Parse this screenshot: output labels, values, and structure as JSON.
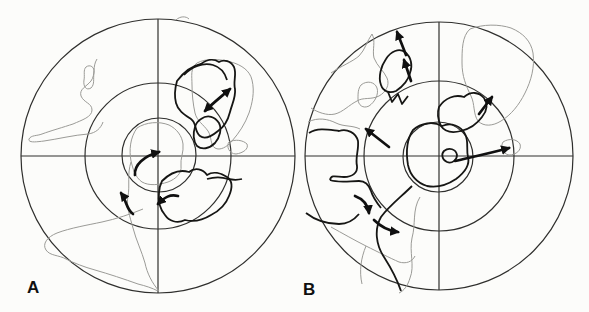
{
  "colors": {
    "background": "#fcfcfa",
    "grid_line": "#2f2f2d",
    "thin_coast": "#9b9b97",
    "bold_coast": "#161614",
    "arrow": "#101010"
  },
  "panels": [
    {
      "label": "A",
      "geometry": {
        "cx": 158,
        "cy": 156,
        "r_outer": 137,
        "r_mid": 73,
        "inner_cx": 159,
        "inner_cy": 155,
        "r_inner": 37,
        "h_line": "M 21,156 L 295,156",
        "v_line": "M 158,19 L 158,293",
        "label_x": 27,
        "label_y": 293
      },
      "thin": [
        "M 97,59 C 92,67 96,74 91,81 C 86,87 79,89 81,96 C 84,103 92,103 92,110 C 92,117 82,120 73,124 C 64,127 50,131 42,134 C 37,136 31,135 29,139 C 28,143 36,142 44,141 C 58,139 74,135 88,134 C 96,133 101,128 103,122",
        "M 86,67 C 90,64 95,67 94,73 C 93,79 95,84 91,88 C 86,91 83,86 84,80 C 85,75 83,70 86,67 Z",
        "M 176,20 C 180,16 186,16 189,19",
        "M 197,63 C 206,58 220,59 231,62 C 242,65 250,71 252,80 C 255,92 252,104 249,113 C 245,124 239,133 232,141 C 227,147 220,151 215,148 C 210,145 212,137 208,131 C 203,124 197,121 195,113 C 193,104 192,94 192,85 C 192,76 190,68 197,63 Z",
        "M 229,142 C 235,139 243,140 247,144 C 249,149 243,153 236,154 C 229,154 226,146 229,142 Z",
        "M 137,128 C 146,122 159,121 169,125 C 177,129 182,136 183,144 C 184,152 180,159 181,166 C 182,173 176,179 168,182 C 159,185 149,186 142,182 C 135,177 133,169 131,161 C 129,150 130,138 137,128 Z",
        "M 131,162 C 127,174 130,186 128,196 C 126,206 130,217 133,228 C 136,240 142,252 145,263 C 147,273 152,283 159,291",
        "M 143,209 C 131,214 116,219 102,222 C 88,225 70,228 57,233 C 47,237 42,244 46,250 C 50,256 59,255 66,259 C 74,263 84,267 95,270 C 109,274 124,279 138,284 C 146,286 152,288 158,291"
      ],
      "bold": [
        "M 177,81 C 183,73 192,66 201,64 C 206,60 213,58 219,62 C 224,59 231,61 234,67 C 237,74 233,81 235,89 C 236,97 232,104 230,112 C 228,120 224,127 218,131 C 212,136 205,140 200,136 C 194,131 197,123 191,119 C 185,115 178,111 176,103 C 174,95 175,88 177,81 Z",
        "M 184,75 C 191,67 203,62 213,65 C 220,67 225,73 227,80",
        "M 201,119 C 208,114 215,117 219,123 C 222,129 220,137 215,143 C 209,149 202,150 197,146 C 193,141 193,133 195,127 C 196,123 198,121 201,119 Z",
        "M 162,181 C 169,174 179,169 189,172 C 195,167 203,169 207,175 C 213,171 221,173 227,177 C 233,181 232,189 229,196 C 226,204 219,211 211,215 C 203,220 193,222 185,220 C 177,224 169,221 165,215 C 160,209 158,201 159,193 C 159,188 160,185 162,181 Z",
        "M 207,179 C 214,177 222,177 228,179 C 233,180 238,180 242,179"
      ],
      "arrows": [
        {
          "name": "antarctica-rotation-arrow",
          "d": "M 135,175 C 134,165 144,156 159,152"
        },
        {
          "name": "africa-spreading-arrow",
          "d": "M 205,111 C 213,103 222,96 230,89"
        },
        {
          "name": "australia-westward-arrow",
          "d": "M 178,196 C 170,194 165,197 158,204"
        },
        {
          "name": "rift-northwest-arrow",
          "d": "M 133,214 C 126,209 127,201 121,193"
        }
      ]
    },
    {
      "label": "B",
      "geometry": {
        "cx": 439,
        "cy": 156,
        "r_outer": 134,
        "r_mid": 75,
        "inner_cx": 438,
        "inner_cy": 157,
        "r_inner": 35,
        "h_line": "M 305,156 L 573,156",
        "v_line": "M 439,22 L 439,290",
        "label_x": 303,
        "label_y": 295
      },
      "thin": [
        "M 331,73 C 341,66 352,62 359,56 C 365,50 367,41 372,34 C 376,41 372,50 374,58 C 377,66 384,71 387,78 C 390,85 386,92 379,96 C 371,100 363,97 357,101 C 349,105 343,112 335,114 C 327,116 317,112 311,108",
        "M 361,85 C 367,80 375,82 377,88 C 379,94 375,102 369,106 C 363,109 358,105 358,99 C 358,93 358,89 361,85 Z",
        "M 308,122 C 318,117 328,119 336,123 C 344,127 352,125 360,129",
        "M 470,29 C 483,24 499,24 511,28 C 523,33 531,41 533,53 C 535,67 531,81 525,93 C 519,105 511,115 501,121 C 493,126 484,127 478,121 C 473,114 475,104 471,96 C 466,86 462,76 462,63 C 462,50 462,36 470,29 Z",
        "M 503,142 C 509,138 517,139 520,144 C 522,150 516,155 509,155 C 503,154 500,147 503,142 Z",
        "M 420,197 C 412,210 416,224 412,238 C 409,252 415,266 410,278 C 408,285 404,291 399,293",
        "M 331,227 C 342,233 354,240 366,246 C 378,252 390,258 399,262 C 406,264 412,262 415,256",
        "M 366,246 C 361,258 359,271 362,284"
      ],
      "bold": [
        "M 309,133 C 318,127 330,130 339,131 C 347,128 356,133 358,141 C 359,150 355,158 357,166 C 358,173 352,177 344,177 C 337,177 331,174 330,180",
        "M 330,180 C 338,183 350,181 359,181 C 365,181 369,185 371,191 C 373,198 377,203 381,208",
        "M 306,213 C 315,220 327,224 339,224 C 347,224 354,220 359,214",
        "M 412,186 C 401,197 389,206 381,217 C 374,229 376,245 384,257 C 391,268 397,279 401,291",
        "M 386,59 C 391,51 399,48 405,52 C 411,57 413,65 410,73 C 408,81 402,87 396,91 C 389,94 383,91 381,85 C 378,77 381,66 386,59 Z",
        "M 388,92 L 392,102 L 398,94 L 402,104 L 408,96",
        "M 439,107 C 445,98 455,94 464,97 C 471,91 479,92 484,98 C 488,104 487,111 482,117 C 477,124 469,129 461,131 C 453,133 445,132 441,126 C 438,120 437,113 439,107 Z",
        "M 413,130 C 421,123 433,121 442,126 C 451,122 461,126 465,134 C 469,141 466,149 468,157 C 470,165 464,173 456,179 C 447,185 437,188 427,186 C 417,183 410,175 408,165 C 406,153 407,139 413,130 Z",
        "M 444,151 C 449,147 456,149 457,155 C 457,160 452,164 447,162 C 442,160 441,154 444,151 Z"
      ],
      "arrows": [
        {
          "name": "india-north-arrow-lower",
          "d": "M 411,81 L 404,60"
        },
        {
          "name": "india-north-arrow-upper",
          "d": "M 406,55 L 397,32"
        },
        {
          "name": "southamerica-northwest-arrow",
          "d": "M 389,147 L 366,129"
        },
        {
          "name": "africa-northeast-arrow",
          "d": "M 479,114 L 492,97"
        },
        {
          "name": "australia-east-arrow",
          "d": "M 455,161 C 472,157 491,153 509,148"
        },
        {
          "name": "southamerica-rotation-arrow-1",
          "d": "M 355,196 C 363,199 368,205 369,213"
        },
        {
          "name": "southamerica-rotation-arrow-2",
          "d": "M 374,220 C 382,228 390,231 398,232"
        }
      ]
    }
  ]
}
